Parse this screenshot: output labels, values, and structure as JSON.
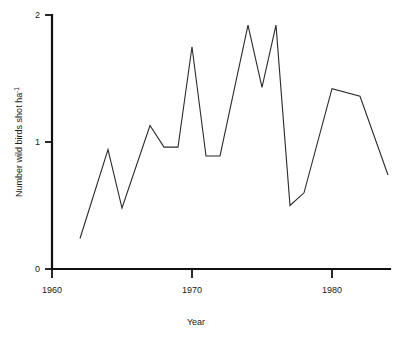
{
  "chart_data": {
    "type": "line",
    "title": "",
    "xlabel": "Year",
    "ylabel": "Number wild birds shot ha",
    "ylabel_superscript": "-1",
    "ylabel_full": "Number wild birds shot ha -1",
    "xlim": [
      1960,
      1985
    ],
    "ylim": [
      0,
      2
    ],
    "xticks": [
      1960,
      1970,
      1980
    ],
    "xtick_labels": [
      "1960",
      "1970",
      "1980"
    ],
    "yticks": [
      0,
      1,
      2
    ],
    "ytick_labels": [
      "0",
      "1",
      "2"
    ],
    "grid": false,
    "legend": false,
    "series": [
      {
        "name": "Number wild birds shot per hectare",
        "x": [
          1962,
          1964,
          1965,
          1967,
          1968,
          1969,
          1970,
          1971,
          1972,
          1974,
          1975,
          1976,
          1977,
          1978,
          1980,
          1982,
          1984
        ],
        "values": [
          0.24,
          0.94,
          0.48,
          1.13,
          0.96,
          0.96,
          1.75,
          0.89,
          0.89,
          1.92,
          1.43,
          1.92,
          0.5,
          0.6,
          1.42,
          1.36,
          0.74
        ]
      }
    ]
  },
  "axes": {
    "y_label_text": "Number wild birds shot ha",
    "y_label_exponent": "-1",
    "x_label_text": "Year",
    "x_ticks": [
      {
        "label": "1960",
        "value": 1960
      },
      {
        "label": "1970",
        "value": 1970
      },
      {
        "label": "1980",
        "value": 1980
      }
    ],
    "y_ticks": [
      {
        "label": "2",
        "value": 2
      },
      {
        "label": "1",
        "value": 1
      },
      {
        "label": "0",
        "value": 0
      }
    ]
  },
  "colors": {
    "line": "#2b2b2b",
    "axis": "#111111",
    "text": "#1a1a1a",
    "background": "#ffffff"
  }
}
